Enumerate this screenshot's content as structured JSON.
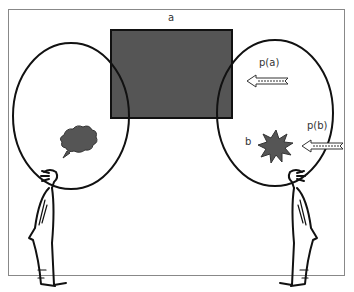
{
  "labels": {
    "top": "a",
    "pa": "p(a)",
    "pb": "p(b)",
    "b": "b"
  },
  "colors": {
    "fill_dark": "#555555",
    "stroke": "#111111",
    "frame": "#888888"
  }
}
